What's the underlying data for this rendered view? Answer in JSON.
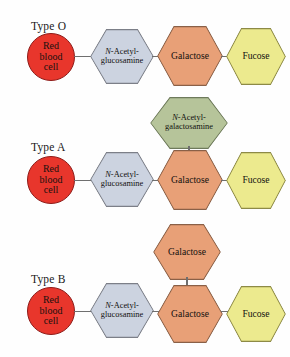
{
  "figure": {
    "background_color": "#fefefe",
    "line_color": "#6f6f6f"
  },
  "palette": {
    "red_blood_cell_fill": "#e8362c",
    "red_blood_cell_border": "#8e1b18",
    "glucosamine_fill": "#ccd3e0",
    "glucosamine_border": "#7c7f88",
    "galactose_fill": "#e8a077",
    "galactose_border": "#8a6047",
    "fucose_fill": "#ecea8e",
    "fucose_border": "#8d8a46",
    "galactosamine_fill": "#b6c49a",
    "galactosamine_border": "#6e7a5b"
  },
  "rows": [
    {
      "id": "type-o",
      "label": "Type O",
      "cell": {
        "line1": "Red",
        "line2": "blood",
        "line3": "cell"
      },
      "chain": [
        {
          "id": "glcnac",
          "prefix_italic": "N",
          "text": "-Acetyl-",
          "text2": "glucosamine"
        },
        {
          "id": "galactose",
          "text": "Galactose"
        },
        {
          "id": "fucose",
          "text": "Fucose"
        }
      ],
      "branch": null
    },
    {
      "id": "type-a",
      "label": "Type A",
      "cell": {
        "line1": "Red",
        "line2": "blood",
        "line3": "cell"
      },
      "chain": [
        {
          "id": "glcnac",
          "prefix_italic": "N",
          "text": "-Acetyl-",
          "text2": "glucosamine"
        },
        {
          "id": "galactose",
          "text": "Galactose"
        },
        {
          "id": "fucose",
          "text": "Fucose"
        }
      ],
      "branch": {
        "id": "galnac",
        "prefix_italic": "N",
        "text": "-Acetyl-",
        "text2": "galactosamine"
      }
    },
    {
      "id": "type-b",
      "label": "Type B",
      "cell": {
        "line1": "Red",
        "line2": "blood",
        "line3": "cell"
      },
      "chain": [
        {
          "id": "glcnac",
          "prefix_italic": "N",
          "text": "-Acetyl-",
          "text2": "glucosamine"
        },
        {
          "id": "galactose",
          "text": "Galactose"
        },
        {
          "id": "fucose",
          "text": "Fucose"
        }
      ],
      "branch": {
        "id": "galactose-branch",
        "text": "Galactose"
      }
    }
  ]
}
